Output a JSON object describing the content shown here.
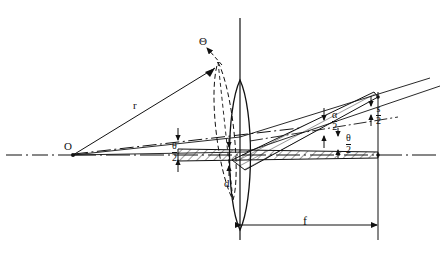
{
  "figure": {
    "type": "optical-ray-diagram",
    "background_color": "#ffffff",
    "ink_color": "#111111"
  },
  "labels": {
    "origin": "O",
    "radius": "r",
    "tilt_angle": "Θ",
    "aperture": "d",
    "focal_length": "f",
    "half_theta_left": {
      "num": "θ",
      "den": "2"
    },
    "half_theta_right": {
      "num": "θ",
      "den": "2"
    },
    "half_alpha": {
      "num": "α",
      "den": "2"
    },
    "half_spot": {
      "num": "s",
      "den": "2"
    }
  },
  "geometry": {
    "optical_axis_y": 155,
    "lens_axis_x": 240,
    "origin_point": [
      72,
      155
    ],
    "focus_point": [
      378,
      97
    ],
    "focal_plane_x": 378,
    "lens_center": [
      240,
      155
    ],
    "lens_half_height": 75,
    "tilted_lens_angle_deg": 14
  },
  "elements": {
    "optical_axis": "dash-dot horizontal centerline",
    "lens_vertical_axis": "solid vertical line through lens",
    "solid_lens": "biconvex lens on axis",
    "dashed_lens": "tilted biconvex lens outline (dashed)",
    "horizontal_beam": "hatched on-axis beam",
    "tilted_beam": "hatched tilted converging beam",
    "ray_r": "ray from O to tilted lens edge labelled r",
    "dimension_f": "horizontal dimension line with arrows labelled f"
  }
}
